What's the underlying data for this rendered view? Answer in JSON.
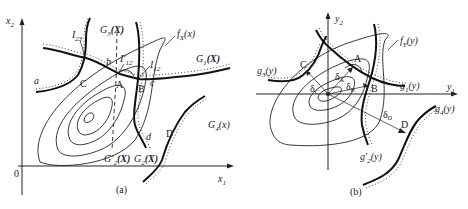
{
  "panel_a": {
    "caption": "(a)",
    "axes": {
      "x": "x",
      "x_sub": "1",
      "y": "x",
      "y_sub": "2",
      "origin": "0"
    },
    "constraints": [
      {
        "id": "G1",
        "label": "G",
        "sub": "1",
        "arg": "(X)"
      },
      {
        "id": "G2",
        "label": "G",
        "sub": "2",
        "arg": "(X)"
      },
      {
        "id": "G2p",
        "label": "G'",
        "sub": "2",
        "arg": "(X)"
      },
      {
        "id": "G3",
        "label": "G",
        "sub": "3",
        "arg": "(X)"
      },
      {
        "id": "G4",
        "label": "G",
        "sub": "4",
        "arg": "(x)"
      }
    ],
    "objective": {
      "label": "f",
      "sub": "X",
      "arg": "(x)"
    },
    "points": [
      "a",
      "b",
      "c",
      "d",
      "A",
      "B",
      "C",
      "D"
    ],
    "intersections": [
      {
        "label": "I",
        "sub": "23"
      },
      {
        "label": "I'",
        "sub": "12"
      },
      {
        "label": "I",
        "sub": "12"
      }
    ]
  },
  "panel_b": {
    "caption": "(b)",
    "axes": {
      "x": "y",
      "x_sub": "1",
      "y": "y",
      "y_sub": "2"
    },
    "constraints": [
      {
        "id": "g1",
        "label": "g",
        "sub": "1",
        "arg": "(y)"
      },
      {
        "id": "g2p",
        "label": "g'",
        "sub": "2",
        "arg": "(y)"
      },
      {
        "id": "g3",
        "label": "g",
        "sub": "3",
        "arg": "(y)"
      },
      {
        "id": "g4",
        "label": "g",
        "sub": "4",
        "arg": "(y)"
      }
    ],
    "objective": {
      "label": "f",
      "sub": "Y",
      "arg": "(y)"
    },
    "points": [
      "A",
      "B",
      "C",
      "D"
    ],
    "distances": [
      {
        "label": "δ",
        "sub": "A"
      },
      {
        "label": "δ",
        "sub": "B"
      },
      {
        "label": "δ",
        "sub": "C"
      },
      {
        "label": "δ",
        "sub": "D"
      }
    ]
  }
}
